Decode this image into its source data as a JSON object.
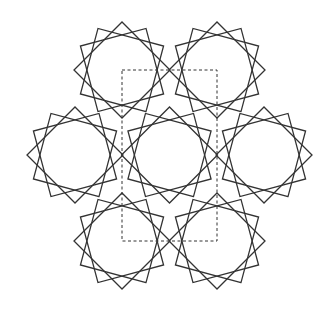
{
  "diagram": {
    "title": "",
    "stroke_color": "#333333",
    "background": "#ffffff",
    "rosette_radius": 48,
    "square_rotations_deg": [
      45,
      15,
      75
    ],
    "rosettes": [
      {
        "id": "top-left",
        "cx": 122,
        "cy": 70
      },
      {
        "id": "top-right",
        "cx": 217,
        "cy": 70
      },
      {
        "id": "middle-left",
        "cx": 75,
        "cy": 155
      },
      {
        "id": "center",
        "cx": 169.5,
        "cy": 155
      },
      {
        "id": "middle-right",
        "cx": 264,
        "cy": 155
      },
      {
        "id": "bottom-left",
        "cx": 122,
        "cy": 241
      },
      {
        "id": "bottom-right",
        "cx": 217,
        "cy": 241
      }
    ],
    "repeat_tile": {
      "x": 122,
      "y": 70,
      "width": 95,
      "height": 171,
      "style": "dashed"
    }
  }
}
